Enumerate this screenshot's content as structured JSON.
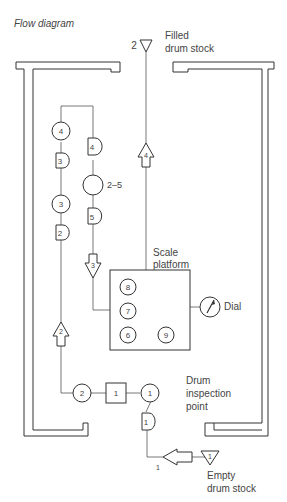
{
  "title": "Flow diagram",
  "labels": {
    "filled_stock_line1": "Filled",
    "filled_stock_line2": "drum stock",
    "filled_stock_num": "2",
    "scale_line1": "Scale",
    "scale_line2": "platform",
    "dial": "Dial",
    "inspection_line1": "Drum",
    "inspection_line2": "inspection",
    "inspection_line3": "point",
    "empty_line1": "Empty",
    "empty_line2": "drum stock",
    "empty_stock_num": "1",
    "transport_1_num": "1"
  },
  "symbols": {
    "op_left_top": "4",
    "delay_left_1": "3",
    "op_left_mid": "3",
    "delay_left_2": "2",
    "transport_left": "2",
    "delay_right_top": "4",
    "op_right_combined": "2–5",
    "delay_right_2": "5",
    "transport_right": "3",
    "transport_up": "4",
    "scale_op_8": "8",
    "scale_op_7": "7",
    "scale_op_6": "6",
    "scale_op_9": "9",
    "op_bottom_2": "2",
    "inspection_box": "1",
    "op_inspection": "1",
    "delay_bottom": "1"
  }
}
